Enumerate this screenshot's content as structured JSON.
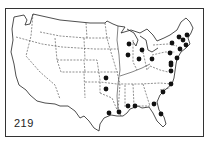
{
  "map": {
    "title": "United States map with marked locations",
    "label": "219",
    "dot_color": "#111111",
    "line_color": "#222222",
    "points": [
      {
        "x": 172,
        "y": 43
      },
      {
        "x": 179,
        "y": 37
      },
      {
        "x": 187,
        "y": 35
      },
      {
        "x": 183,
        "y": 40
      },
      {
        "x": 186,
        "y": 45
      },
      {
        "x": 180,
        "y": 49
      },
      {
        "x": 170,
        "y": 53
      },
      {
        "x": 177,
        "y": 58
      },
      {
        "x": 171,
        "y": 63
      },
      {
        "x": 171,
        "y": 65
      },
      {
        "x": 171,
        "y": 71
      },
      {
        "x": 171,
        "y": 84
      },
      {
        "x": 163,
        "y": 92
      },
      {
        "x": 154,
        "y": 104
      },
      {
        "x": 161,
        "y": 114
      },
      {
        "x": 135,
        "y": 106
      },
      {
        "x": 128,
        "y": 106
      },
      {
        "x": 119,
        "y": 112
      },
      {
        "x": 109,
        "y": 113
      },
      {
        "x": 106,
        "y": 78
      },
      {
        "x": 106,
        "y": 89
      },
      {
        "x": 129,
        "y": 44
      },
      {
        "x": 142,
        "y": 50
      },
      {
        "x": 128,
        "y": 55
      },
      {
        "x": 139,
        "y": 59
      },
      {
        "x": 152,
        "y": 59
      }
    ]
  }
}
